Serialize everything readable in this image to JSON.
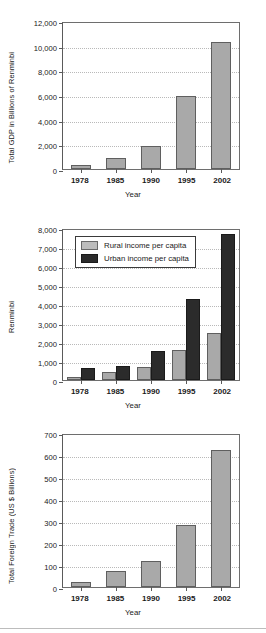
{
  "figure": {
    "background": "#ffffff",
    "bar_gray": "#a9a9a9",
    "bar_dark": "#2b2b2b"
  },
  "chart_data": [
    {
      "type": "bar",
      "id": "gdp",
      "title": "",
      "xlabel": "Year",
      "ylabel": "Total GDP in Billions of Renminbi",
      "categories": [
        "1978",
        "1985",
        "1990",
        "1995",
        "2002"
      ],
      "values": [
        362,
        897,
        1880,
        5900,
        10310
      ],
      "ylim": [
        0,
        12000
      ],
      "yticks": [
        0,
        2000,
        4000,
        6000,
        8000,
        10000,
        12000
      ],
      "ytick_labels": [
        "0",
        "2,000",
        "4,000",
        "6,000",
        "8,000",
        "10,000",
        "12,000"
      ],
      "grid": true,
      "legend": null,
      "series_color": "#a9a9a9"
    },
    {
      "type": "bar",
      "id": "income",
      "title": "",
      "xlabel": "Year",
      "ylabel": "Renminbi",
      "categories": [
        "1978",
        "1985",
        "1990",
        "1995",
        "2002"
      ],
      "series": [
        {
          "name": "Rural income per capita",
          "color": "#a9a9a9",
          "values": [
            134,
            398,
            686,
            1578,
            2476
          ]
        },
        {
          "name": "Urban income per capita",
          "color": "#2b2b2b",
          "values": [
            615,
            739,
            1510,
            4283,
            7703
          ]
        }
      ],
      "ylim": [
        0,
        8000
      ],
      "yticks": [
        0,
        1000,
        2000,
        3000,
        4000,
        5000,
        6000,
        7000,
        8000
      ],
      "ytick_labels": [
        "0",
        "1,000",
        "2,000",
        "3,000",
        "4,000",
        "5,000",
        "6,000",
        "7,000",
        "8,000"
      ],
      "grid": true,
      "legend": {
        "position": "top-left-inside",
        "entries": [
          "Rural income per capita",
          "Urban income per capita"
        ]
      }
    },
    {
      "type": "bar",
      "id": "trade",
      "title": "",
      "xlabel": "Year",
      "ylabel": "Total Foreign Trade (US $ Billions)",
      "categories": [
        "1978",
        "1985",
        "1990",
        "1995",
        "2002"
      ],
      "values": [
        21,
        74,
        116,
        281,
        621
      ],
      "ylim": [
        0,
        700
      ],
      "yticks": [
        0,
        100,
        200,
        300,
        400,
        500,
        600,
        700
      ],
      "ytick_labels": [
        "0",
        "100",
        "200",
        "300",
        "400",
        "500",
        "600",
        "700"
      ],
      "grid": true,
      "legend": null,
      "series_color": "#a9a9a9"
    }
  ]
}
